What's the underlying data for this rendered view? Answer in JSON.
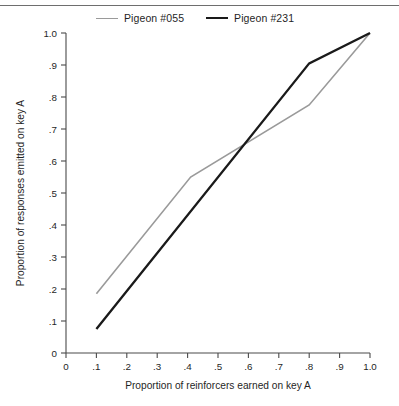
{
  "figure": {
    "has_top_rule": true
  },
  "legend": {
    "position": "top",
    "entries": [
      {
        "label": "Pigeon #055",
        "color": "#9a9a9a",
        "style": "thin"
      },
      {
        "label": "Pigeon #231",
        "color": "#1a1a1a",
        "style": "thick"
      }
    ]
  },
  "chart_data": {
    "type": "line",
    "title": "",
    "xlabel": "Proportion of reinforcers earned on key A",
    "ylabel": "Proportion of responses emitted on key A",
    "xlim": [
      0,
      1.0
    ],
    "ylim": [
      0,
      1.0
    ],
    "grid": false,
    "legend_position": "top",
    "xticks": [
      0,
      0.1,
      0.2,
      0.3,
      0.4,
      0.5,
      0.6,
      0.7,
      0.8,
      0.9,
      1.0
    ],
    "xticklabels": [
      "0",
      ".1",
      ".2",
      ".3",
      ".4",
      ".5",
      ".6",
      ".7",
      ".8",
      ".9",
      "1.0"
    ],
    "yticks": [
      0,
      0.1,
      0.2,
      0.3,
      0.4,
      0.5,
      0.6,
      0.7,
      0.8,
      0.9,
      1.0
    ],
    "yticklabels": [
      "0",
      ".1",
      ".2",
      ".3",
      ".4",
      ".5",
      ".6",
      ".7",
      ".8",
      ".9",
      "1.0"
    ],
    "series": [
      {
        "name": "Pigeon #055",
        "color": "#9a9a9a",
        "width": 1.6,
        "x": [
          0.1,
          0.41,
          0.8,
          1.0
        ],
        "y": [
          0.185,
          0.55,
          0.775,
          1.0
        ]
      },
      {
        "name": "Pigeon #231",
        "color": "#1a1a1a",
        "width": 2.3,
        "x": [
          0.1,
          0.8,
          1.0
        ],
        "y": [
          0.075,
          0.905,
          1.0
        ]
      }
    ]
  }
}
